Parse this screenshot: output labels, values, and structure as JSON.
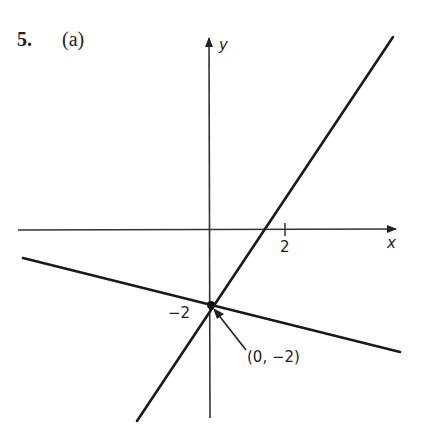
{
  "problem": {
    "number": "5.",
    "part": "(a)"
  },
  "axes": {
    "x_label": "x",
    "y_label": "y",
    "x_tick_label": "2",
    "y_tick_label": "−2"
  },
  "annotation": {
    "point_label": "(0, −2)"
  },
  "lines": [
    {
      "name": "steep-line",
      "slope": 2,
      "intercept": -2
    },
    {
      "name": "shallow-line",
      "slope": -0.5,
      "intercept": -2
    }
  ],
  "colors": {
    "ink": "#222222",
    "background": "#ffffff"
  }
}
